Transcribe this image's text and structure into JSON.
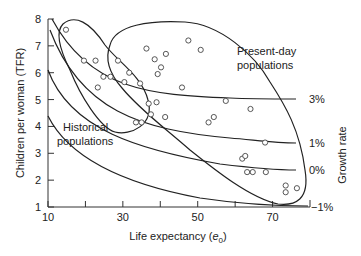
{
  "chart_data": {
    "type": "scatter",
    "title": "",
    "xlabel": "Life expectancy (e0)",
    "xlabel_main": "Life expectancy (",
    "xlabel_var": "e",
    "xlabel_sub": "0",
    "xlabel_close": ")",
    "ylabel": "Children per woman (TFR)",
    "right_label": "Growth rate",
    "xlim": [
      10,
      80
    ],
    "ylim": [
      1,
      8
    ],
    "x_ticks": [
      10,
      30,
      50,
      70
    ],
    "x_minor_ticks": [
      20,
      40,
      60
    ],
    "y_ticks": [
      1,
      2,
      3,
      4,
      5,
      6,
      7,
      8
    ],
    "grid": false,
    "growth_rate_curves": [
      {
        "label": "3%",
        "rate": 3
      },
      {
        "label": "1%",
        "rate": 1
      },
      {
        "label": "0%",
        "rate": 0
      },
      {
        "label": "−1%",
        "rate": -1
      }
    ],
    "regions": [
      {
        "name": "Historical populations",
        "line1": "Historical",
        "line2": "populations"
      },
      {
        "name": "Present-day populations",
        "line1": "Present-day",
        "line2": "populations"
      }
    ],
    "series": [
      {
        "name": "Historical populations",
        "points": [
          [
            14.8,
            7.6
          ],
          [
            19.6,
            6.45
          ],
          [
            22.7,
            6.45
          ],
          [
            24.8,
            5.85
          ],
          [
            26.7,
            5.85
          ],
          [
            23.3,
            5.45
          ],
          [
            28.7,
            6.45
          ],
          [
            30.4,
            5.65
          ],
          [
            31.7,
            6.0
          ],
          [
            33.5,
            4.15
          ],
          [
            35.0,
            4.15
          ]
        ]
      },
      {
        "name": "Present-day populations",
        "points": [
          [
            36.3,
            6.9
          ],
          [
            38.5,
            6.5
          ],
          [
            40.2,
            6.2
          ],
          [
            41.5,
            6.7
          ],
          [
            39.3,
            5.95
          ],
          [
            34.6,
            5.6
          ],
          [
            36.9,
            4.85
          ],
          [
            37.5,
            4.45
          ],
          [
            39.0,
            4.9
          ],
          [
            41.3,
            4.35
          ],
          [
            47.5,
            7.2
          ],
          [
            50.8,
            6.85
          ],
          [
            45.8,
            5.45
          ],
          [
            52.9,
            4.15
          ],
          [
            54.3,
            4.35
          ],
          [
            57.5,
            4.95
          ],
          [
            64.1,
            4.65
          ],
          [
            68.0,
            3.4
          ],
          [
            61.9,
            2.8
          ],
          [
            62.7,
            2.9
          ],
          [
            63.2,
            2.3
          ],
          [
            64.7,
            2.3
          ],
          [
            68.2,
            2.3
          ],
          [
            73.5,
            1.8
          ],
          [
            73.5,
            1.55
          ],
          [
            76.5,
            1.7
          ]
        ]
      }
    ]
  }
}
